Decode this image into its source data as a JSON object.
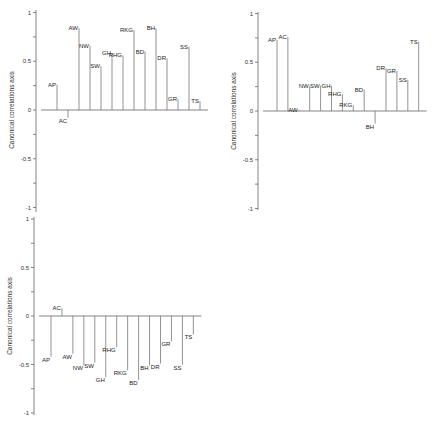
{
  "chart_data": [
    {
      "type": "bar",
      "subtype": "stem",
      "panel": "top-left",
      "title": "",
      "xlabel": "",
      "ylabel": "Canonical correlations axis",
      "ylim": [
        -1,
        1
      ],
      "yticks": [
        1,
        0.5,
        0,
        -0.5,
        -1
      ],
      "ytick_labels": [
        "1",
        "0.5",
        "0",
        "-0.5",
        "-1"
      ],
      "grid": false,
      "categories": [
        "AP",
        "AC",
        "AW",
        "NW",
        "SW",
        "GH",
        "RHG",
        "RKG",
        "BD",
        "BH",
        "DR",
        "GR",
        "SS",
        "TS"
      ],
      "values": [
        0.26,
        -0.08,
        0.84,
        0.66,
        0.45,
        0.58,
        0.56,
        0.82,
        0.6,
        0.84,
        0.53,
        0.11,
        0.65,
        0.09
      ]
    },
    {
      "type": "bar",
      "subtype": "stem",
      "panel": "top-right",
      "title": "",
      "xlabel": "",
      "ylabel": "Canonical correlations axis",
      "ylim": [
        -1,
        1
      ],
      "yticks": [
        1,
        0.5,
        0,
        -0.5,
        -1
      ],
      "ytick_labels": [
        "1",
        "0.5",
        "0",
        "-0.5",
        "-1"
      ],
      "grid": false,
      "categories": [
        "AP",
        "AC",
        "AW",
        "NW",
        "SW",
        "GH",
        "RHG",
        "RKG",
        "BD",
        "BH",
        "DR",
        "GR",
        "SS",
        "TS"
      ],
      "values": [
        0.73,
        0.76,
        0.01,
        0.26,
        0.26,
        0.26,
        0.17,
        0.06,
        0.22,
        -0.13,
        0.44,
        0.41,
        0.32,
        0.71
      ]
    },
    {
      "type": "bar",
      "subtype": "stem",
      "panel": "bottom-left",
      "title": "",
      "xlabel": "",
      "ylabel": "Canonical correlations axis",
      "ylim": [
        -1,
        1
      ],
      "yticks": [
        1,
        0.5,
        0,
        -0.5,
        -1
      ],
      "ytick_labels": [
        "1",
        "0.5",
        "0",
        "-0.5",
        "-1"
      ],
      "grid": false,
      "categories": [
        "AP",
        "AC",
        "AW",
        "NW",
        "SW",
        "GH",
        "RHG",
        "RKG",
        "BD",
        "BH",
        "DR",
        "GR",
        "SS",
        "TS"
      ],
      "values": [
        -0.42,
        0.08,
        -0.39,
        -0.51,
        -0.48,
        -0.63,
        -0.32,
        -0.56,
        -0.66,
        -0.51,
        -0.49,
        -0.26,
        -0.5,
        -0.19
      ]
    }
  ],
  "layout": {
    "panels": [
      {
        "left": 0,
        "top": 0,
        "axis_x": 36,
        "zero_y": 110,
        "px_per_unit": 97.5,
        "first_bar_x": 57,
        "bar_step": 11.0,
        "axis_top": 10,
        "axis_bottom": 212
      },
      {
        "left": 0,
        "top": 0,
        "axis_x": 258,
        "zero_y": 111,
        "px_per_unit": 97.5,
        "first_bar_x": 277,
        "bar_step": 10.9,
        "axis_top": 12,
        "axis_bottom": 210
      },
      {
        "left": 0,
        "top": 0,
        "axis_x": 34,
        "zero_y": 316,
        "px_per_unit": 97.0,
        "first_bar_x": 51,
        "bar_step": 10.95,
        "axis_top": 217,
        "axis_bottom": 415
      }
    ]
  }
}
